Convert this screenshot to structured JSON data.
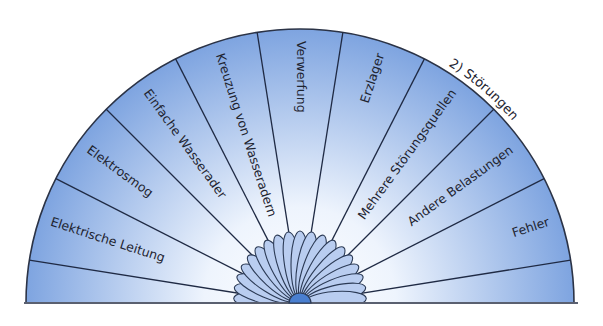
{
  "diagram": {
    "title": "2) Störungen",
    "type": "semicircle-pendulum-chart",
    "sectors": [
      {
        "label": ""
      },
      {
        "label": "Elektrische Leitung"
      },
      {
        "label": "Elektrosmog"
      },
      {
        "label": "Einfache Wasserader"
      },
      {
        "label": "Kreuzung von Wasseradern"
      },
      {
        "label": "Verwerfung"
      },
      {
        "label": "Erzlager"
      },
      {
        "label": "Mehrere Störungsquellen"
      },
      {
        "label": "Andere Belastungen"
      },
      {
        "label": "Fehler"
      },
      {
        "label": ""
      }
    ],
    "colors": {
      "edge_blue": "#7fa5e0",
      "center_white": "#f6f9ff",
      "petal": "#b9cdf0",
      "petal_stroke": "#2b3a55",
      "hub": "#4a7fd0",
      "line": "#1f2a44"
    }
  }
}
